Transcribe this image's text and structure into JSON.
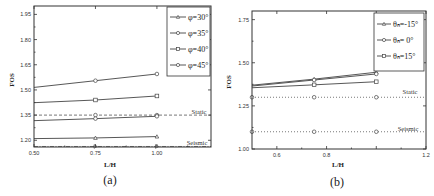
{
  "chart_data": [
    {
      "id": "a",
      "type": "line",
      "caption": "(a)",
      "xlabel": "L/H",
      "ylabel": "FOS",
      "xlim": [
        0.5,
        1.22
      ],
      "ylim": [
        1.16,
        2.0
      ],
      "xticks": [
        0.5,
        0.75,
        1.0
      ],
      "xtick_labels": [
        "0.50",
        "0.75",
        "1.00"
      ],
      "yticks": [
        1.2,
        1.35,
        1.5,
        1.65,
        1.8,
        1.95
      ],
      "ytick_labels": [
        "1.20",
        "1.35",
        "1.50",
        "1.65",
        "1.80",
        "1.95"
      ],
      "grid": false,
      "legend_position": "upper right",
      "x": [
        0.5,
        0.75,
        1.0
      ],
      "series": [
        {
          "name": "φ=30°",
          "marker": "triangle",
          "dash": "solid",
          "values": [
            1.21,
            1.214,
            1.222
          ]
        },
        {
          "name": "φ=35°",
          "marker": "circle",
          "dash": "solid",
          "values": [
            1.317,
            1.329,
            1.343
          ]
        },
        {
          "name": "φ=40°",
          "marker": "square",
          "dash": "solid",
          "values": [
            1.424,
            1.44,
            1.464
          ]
        },
        {
          "name": "φ=45°",
          "marker": "circle",
          "dash": "solid",
          "values": [
            1.515,
            1.555,
            1.595
          ]
        }
      ],
      "reference_lines": [
        {
          "label": "Static",
          "value": 1.35,
          "dash": "dashed",
          "marker": "circle"
        },
        {
          "label": "Seismic",
          "value": 1.163,
          "dash": "dashdot",
          "marker": "triangle-right"
        }
      ]
    },
    {
      "id": "b",
      "type": "line",
      "caption": "(b)",
      "xlabel": "L/H",
      "ylabel": "FOS",
      "xlim": [
        0.5,
        1.2
      ],
      "ylim": [
        1.0,
        1.8
      ],
      "xticks": [
        0.6,
        0.8,
        1.0,
        1.2
      ],
      "xtick_labels": [
        "0.6",
        "0.8",
        "",
        "1.2"
      ],
      "yticks": [
        1.0,
        1.25,
        1.5,
        1.75
      ],
      "ytick_labels": [
        "1.00",
        "1.25",
        "1.50",
        "1.75"
      ],
      "grid": false,
      "legend_position": "upper right",
      "x": [
        0.5,
        0.75,
        1.0
      ],
      "series": [
        {
          "name": "θₕ=-15°",
          "marker": "triangle",
          "dash": "solid",
          "values": [
            1.37,
            1.405,
            1.445
          ]
        },
        {
          "name": "θₕ= 0°",
          "marker": "circle",
          "dash": "solid",
          "values": [
            1.365,
            1.4,
            1.435
          ]
        },
        {
          "name": "θₕ=15°",
          "marker": "square",
          "dash": "solid",
          "values": [
            1.355,
            1.372,
            1.39
          ]
        }
      ],
      "reference_lines": [
        {
          "label": "Static",
          "value": 1.3,
          "dash": "dotted",
          "marker": "circle"
        },
        {
          "label": "Seismic",
          "value": 1.1,
          "dash": "dotted",
          "marker": "circle"
        }
      ]
    }
  ],
  "panels": {
    "a": {
      "caption": "(a)",
      "xlabel": "L/H",
      "ylabel": "FOS",
      "static_label": "Static",
      "seismic_label": "Seismic",
      "xtick_labels": [
        "0.50",
        "0.75",
        "1.00"
      ],
      "ytick_labels": [
        "1.20",
        "1.35",
        "1.50",
        "1.65",
        "1.80",
        "1.95"
      ],
      "legend": [
        "φ=30°",
        "φ=35°",
        "φ=40°",
        "φ=45°"
      ]
    },
    "b": {
      "caption": "(b)",
      "xlabel": "L/H",
      "ylabel": "FOS",
      "static_label": "Static",
      "seismic_label": "Seismic",
      "xtick_labels": [
        "0.6",
        "0.8",
        "1.2"
      ],
      "ytick_labels": [
        "1.00",
        "1.25",
        "1.50",
        "1.75"
      ],
      "legend": [
        "θₕ=-15°",
        "θₕ= 0°",
        "θₕ=15°"
      ]
    }
  },
  "colors": {
    "line": "#444444",
    "axis": "#333333",
    "background": "#ffffff"
  }
}
